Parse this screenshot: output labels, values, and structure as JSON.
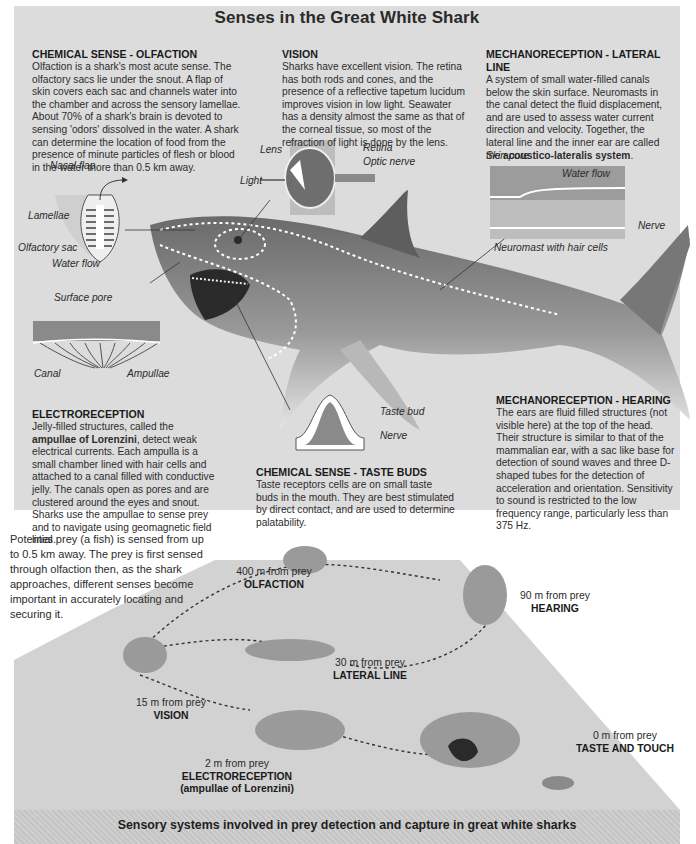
{
  "title": "Senses in the Great White Shark",
  "sections": {
    "olfaction": {
      "heading": "CHEMICAL SENSE - OLFACTION",
      "body": "Olfaction is a shark's most acute sense. The olfactory sacs lie under the snout. A flap of skin covers each sac and channels water into the chamber and across the sensory lamellae. About 70% of a shark's brain is devoted to sensing 'odors' dissolved in the water. A shark can determine the location of food from the presence of minute particles of flesh or blood in the water more than 0.5 km away."
    },
    "vision": {
      "heading": "VISION",
      "body": "Sharks have excellent vision. The retina has both rods and cones, and the presence of a reflective tapetum lucidum improves vision in low light. Seawater has a density almost the same as that of the corneal tissue, so most of the refraction of light is done by the lens."
    },
    "lateral_line": {
      "heading": "MECHANORECEPTION -  LATERAL LINE",
      "body_pre": "A system of small water-filled canals below the skin surface. Neuromasts in the canal detect the fluid displacement, and are used to assess water current direction and velocity. Together, the lateral line and the inner ear are called the ",
      "body_bold": "acoustico-lateralis system",
      "body_post": "."
    },
    "electroreception": {
      "heading": "ELECTRORECEPTION",
      "body_pre": "Jelly-filled structures, called the ",
      "body_bold": "ampullae of Lorenzini",
      "body_post": ", detect weak electrical currents. Each ampulla is a small chamber lined with hair cells and attached to a canal filled with conductive jelly. The canals open as pores and are clustered around the eyes and snout. Sharks use the ampullae to sense prey and to navigate using geomagnetic field lines."
    },
    "taste": {
      "heading": "CHEMICAL SENSE - TASTE BUDS",
      "body": "Taste receptors cells are on small taste buds in the mouth. They are best stimulated by direct contact, and are used to determine palatability."
    },
    "hearing": {
      "heading": "MECHANORECEPTION - HEARING",
      "body": "The ears are fluid filled structures (not visible here) at the top of the head. Their structure is similar to that of the mammalian ear, with a sac like base for detection of sound waves and three D-shaped tubes for the detection of acceleration and orientation. Sensitivity to sound is restricted to the low frequency range, particularly less than 375 Hz."
    }
  },
  "labels": {
    "nasal_flap": "Nasal flap",
    "lamellae": "Lamellae",
    "olfactory_sac": "Olfactory sac",
    "water_flow": "Water flow",
    "surface_pore": "Surface pore",
    "canal": "Canal",
    "ampullae": "Ampullae",
    "lens": "Lens",
    "retina": "Retina",
    "optic_nerve": "Optic nerve",
    "light": "Light",
    "skin_pore": "Skin pore",
    "water_flow_ll": "Water flow",
    "nerve_ll": "Nerve",
    "neuromast": "Neuromast with hair cells",
    "taste_bud": "Taste bud",
    "nerve_taste": "Nerve"
  },
  "sequence": {
    "intro": "Potential prey (a fish) is sensed from up to 0.5 km away. The prey is first sensed through olfaction then, as the shark approaches, different senses become important in accurately locating and securing it.",
    "stages": [
      {
        "distance": "400 m from prey",
        "sense": "OLFACTION"
      },
      {
        "distance": "90 m from prey",
        "sense": "HEARING"
      },
      {
        "distance": "30 m from prey",
        "sense": "LATERAL  LINE"
      },
      {
        "distance": "15 m from prey",
        "sense": "VISION"
      },
      {
        "distance": "2 m from prey",
        "sense": "ELECTRORECEPTION",
        "sense2": "(ampullae of Lorenzini)"
      },
      {
        "distance": "0 m from prey",
        "sense": "TASTE AND TOUCH"
      }
    ]
  },
  "caption": "Sensory systems involved in prey detection and capture in great white sharks",
  "colors": {
    "panel_bg": "#dcdcdc",
    "plateau": "#d2d2d2",
    "shark": "#8c8c8c",
    "text": "#2c2c2c"
  }
}
